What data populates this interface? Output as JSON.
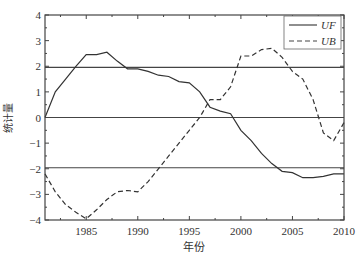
{
  "chart_data": {
    "type": "line",
    "title": "",
    "xlabel": "年份",
    "ylabel": "统计量",
    "xlim": [
      1981,
      2010
    ],
    "ylim": [
      -4,
      4
    ],
    "xticks": [
      1985,
      1990,
      1995,
      2000,
      2005,
      2010
    ],
    "yticks": [
      -4,
      -3,
      -2,
      -1,
      0,
      1,
      2,
      3,
      4
    ],
    "reference_lines": [
      1.96,
      0,
      -1.96
    ],
    "grid": false,
    "legend_position": "upper right",
    "x": [
      1981,
      1982,
      1983,
      1984,
      1985,
      1986,
      1987,
      1988,
      1989,
      1990,
      1991,
      1992,
      1993,
      1994,
      1995,
      1996,
      1997,
      1998,
      1999,
      2000,
      2001,
      2002,
      2003,
      2004,
      2005,
      2006,
      2007,
      2008,
      2009,
      2010
    ],
    "series": [
      {
        "name": "UF",
        "style": "solid",
        "values": [
          0,
          1.0,
          1.5,
          2.0,
          2.45,
          2.45,
          2.55,
          2.2,
          1.9,
          1.9,
          1.8,
          1.65,
          1.6,
          1.4,
          1.35,
          1.0,
          0.4,
          0.25,
          0.15,
          -0.5,
          -0.9,
          -1.4,
          -1.8,
          -2.1,
          -2.15,
          -2.35,
          -2.35,
          -2.3,
          -2.2,
          -2.2
        ]
      },
      {
        "name": "UB",
        "style": "dashed",
        "values": [
          -2.2,
          -2.9,
          -3.4,
          -3.7,
          -3.95,
          -3.6,
          -3.2,
          -2.9,
          -2.85,
          -2.9,
          -2.5,
          -2.0,
          -1.5,
          -1.0,
          -0.5,
          0.0,
          0.7,
          0.7,
          1.2,
          2.4,
          2.4,
          2.65,
          2.7,
          2.35,
          1.8,
          1.5,
          0.7,
          -0.6,
          -0.9,
          -0.2
        ]
      }
    ]
  }
}
